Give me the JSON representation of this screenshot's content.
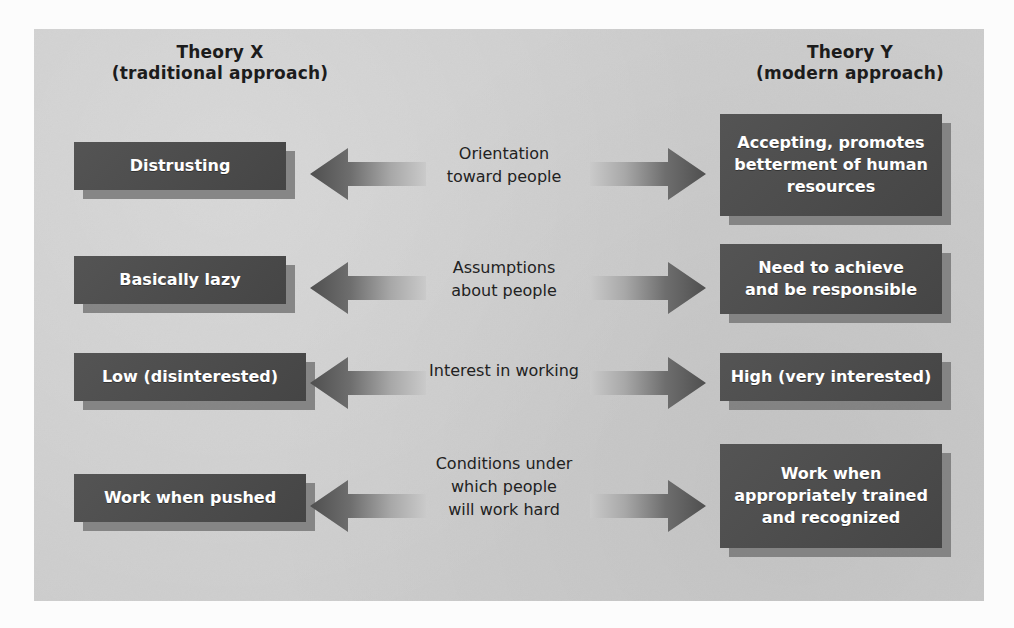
{
  "panel": {
    "background_color": "#cdcdcd",
    "box_color": "#4b4b4b",
    "box_text_color": "#ffffff",
    "shadow_color": "#9a9a9a",
    "label_text_color": "#222222"
  },
  "headers": {
    "left": "Theory X\n(traditional approach)",
    "right": "Theory Y\n(modern approach)"
  },
  "rows": [
    {
      "left": "Distrusting",
      "center": "Orientation\ntoward people",
      "right": "Accepting, promotes\nbetterment of human\nresources",
      "left_arrow": "arrow-left-icon",
      "right_arrow": "arrow-right-icon"
    },
    {
      "left": "Basically lazy",
      "center": "Assumptions\nabout people",
      "right": "Need to achieve\nand be responsible",
      "left_arrow": "arrow-left-icon",
      "right_arrow": "arrow-right-icon"
    },
    {
      "left": "Low (disinterested)",
      "center": "Interest in working",
      "right": "High (very interested)",
      "left_arrow": "arrow-left-icon",
      "right_arrow": "arrow-right-icon"
    },
    {
      "left": "Work when pushed",
      "center": "Conditions under\nwhich people\nwill work hard",
      "right": "Work when\nappropriately trained\nand recognized",
      "left_arrow": "arrow-left-icon",
      "right_arrow": "arrow-right-icon"
    }
  ]
}
